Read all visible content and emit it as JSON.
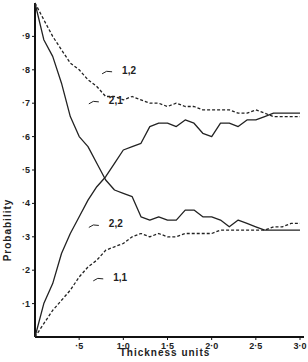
{
  "chart_data": {
    "type": "line",
    "title": "",
    "xlabel": "Thickness  units",
    "ylabel": "Probability",
    "xlim": [
      0,
      3.0
    ],
    "ylim": [
      0,
      1.0
    ],
    "grid": false,
    "legend": "inline annotations",
    "x_ticks": [
      "·5",
      "1·0",
      "1·5",
      "2·0",
      "2·5",
      "3·0"
    ],
    "x_tick_values": [
      0.5,
      1.0,
      1.5,
      2.0,
      2.5,
      3.0
    ],
    "y_ticks": [
      "·1",
      "·2",
      "·3",
      "·4",
      "·5",
      "·6",
      "·7",
      "·8",
      "·9"
    ],
    "y_tick_values": [
      0.1,
      0.2,
      0.3,
      0.4,
      0.5,
      0.6,
      0.7,
      0.8,
      0.9
    ],
    "x": [
      0,
      0.1,
      0.2,
      0.3,
      0.4,
      0.5,
      0.6,
      0.7,
      0.8,
      0.9,
      1.0,
      1.1,
      1.2,
      1.3,
      1.4,
      1.5,
      1.6,
      1.7,
      1.8,
      1.9,
      2.0,
      2.1,
      2.2,
      2.3,
      2.4,
      2.5,
      2.6,
      2.7,
      2.8,
      2.9,
      3.0
    ],
    "series": [
      {
        "name": "1,2",
        "style": "dashed",
        "values": [
          1.0,
          0.95,
          0.9,
          0.86,
          0.82,
          0.8,
          0.77,
          0.75,
          0.72,
          0.72,
          0.71,
          0.72,
          0.71,
          0.7,
          0.7,
          0.69,
          0.7,
          0.69,
          0.69,
          0.68,
          0.68,
          0.68,
          0.68,
          0.67,
          0.67,
          0.68,
          0.67,
          0.66,
          0.66,
          0.66,
          0.66
        ]
      },
      {
        "name": "2,1",
        "style": "solid",
        "values": [
          1.0,
          0.89,
          0.84,
          0.76,
          0.66,
          0.6,
          0.57,
          0.52,
          0.47,
          0.44,
          0.43,
          0.42,
          0.36,
          0.35,
          0.36,
          0.35,
          0.35,
          0.38,
          0.38,
          0.36,
          0.36,
          0.35,
          0.33,
          0.35,
          0.34,
          0.33,
          0.32,
          0.32,
          0.32,
          0.32,
          0.32
        ]
      },
      {
        "name": "2,2",
        "style": "solid",
        "values": [
          0.0,
          0.1,
          0.16,
          0.25,
          0.31,
          0.36,
          0.41,
          0.45,
          0.48,
          0.52,
          0.56,
          0.57,
          0.58,
          0.63,
          0.64,
          0.64,
          0.63,
          0.65,
          0.64,
          0.61,
          0.6,
          0.64,
          0.64,
          0.63,
          0.65,
          0.65,
          0.66,
          0.67,
          0.67,
          0.67,
          0.67
        ]
      },
      {
        "name": "1,1",
        "style": "dashed",
        "values": [
          0.0,
          0.04,
          0.08,
          0.11,
          0.14,
          0.18,
          0.21,
          0.23,
          0.26,
          0.27,
          0.28,
          0.3,
          0.31,
          0.3,
          0.31,
          0.3,
          0.3,
          0.31,
          0.31,
          0.31,
          0.31,
          0.32,
          0.32,
          0.32,
          0.32,
          0.32,
          0.32,
          0.33,
          0.33,
          0.34,
          0.34
        ]
      }
    ],
    "annotations": [
      {
        "text": "1,2",
        "x": 0.85,
        "y": 0.8
      },
      {
        "text": "2,1",
        "x": 0.7,
        "y": 0.71
      },
      {
        "text": "2,2",
        "x": 0.7,
        "y": 0.34
      },
      {
        "text": "1,1",
        "x": 0.75,
        "y": 0.18
      }
    ]
  }
}
